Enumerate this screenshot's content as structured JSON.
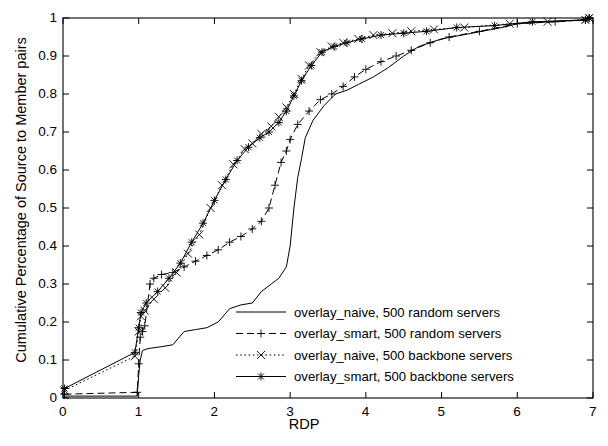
{
  "chart_data": {
    "type": "line",
    "title": "",
    "xlabel": "RDP",
    "ylabel": "Cumulative Percentage of Source to Member pairs",
    "xlim": [
      0,
      7
    ],
    "ylim": [
      0,
      1
    ],
    "xticks": [
      "0",
      "1",
      "2",
      "3",
      "4",
      "5",
      "6",
      "7"
    ],
    "yticks": [
      "0",
      "0.1",
      "0.2",
      "0.3",
      "0.4",
      "0.5",
      "0.6",
      "0.7",
      "0.8",
      "0.9",
      "1"
    ],
    "grid": false,
    "legend_position": "lower right",
    "series": [
      {
        "name": "overlay_naive, 500 random servers",
        "marker": "none",
        "dash": "solid",
        "points": [
          [
            0.02,
            0.005
          ],
          [
            0.98,
            0.005
          ],
          [
            1.0,
            0.06
          ],
          [
            1.02,
            0.1
          ],
          [
            1.05,
            0.125
          ],
          [
            1.12,
            0.13
          ],
          [
            1.3,
            0.135
          ],
          [
            1.45,
            0.14
          ],
          [
            1.6,
            0.175
          ],
          [
            1.75,
            0.18
          ],
          [
            1.9,
            0.185
          ],
          [
            2.05,
            0.2
          ],
          [
            2.2,
            0.235
          ],
          [
            2.35,
            0.245
          ],
          [
            2.5,
            0.25
          ],
          [
            2.62,
            0.28
          ],
          [
            2.75,
            0.3
          ],
          [
            2.85,
            0.315
          ],
          [
            2.95,
            0.345
          ],
          [
            3.0,
            0.4
          ],
          [
            3.05,
            0.5
          ],
          [
            3.1,
            0.58
          ],
          [
            3.15,
            0.63
          ],
          [
            3.2,
            0.685
          ],
          [
            3.3,
            0.73
          ],
          [
            3.45,
            0.77
          ],
          [
            3.6,
            0.8
          ],
          [
            3.75,
            0.81
          ],
          [
            3.9,
            0.825
          ],
          [
            4.1,
            0.845
          ],
          [
            4.3,
            0.87
          ],
          [
            4.5,
            0.9
          ],
          [
            4.7,
            0.925
          ],
          [
            5.0,
            0.945
          ],
          [
            5.4,
            0.96
          ],
          [
            5.8,
            0.975
          ],
          [
            6.0,
            0.985
          ],
          [
            6.4,
            0.99
          ],
          [
            6.9,
            0.995
          ],
          [
            6.95,
            1.0
          ]
        ]
      },
      {
        "name": "overlay_smart, 500 random servers",
        "marker": "plus",
        "dash": "dashed",
        "points": [
          [
            0.02,
            0.01
          ],
          [
            0.98,
            0.015
          ],
          [
            1.0,
            0.09
          ],
          [
            1.02,
            0.16
          ],
          [
            1.05,
            0.175
          ],
          [
            1.08,
            0.19
          ],
          [
            1.15,
            0.3
          ],
          [
            1.2,
            0.315
          ],
          [
            1.3,
            0.325
          ],
          [
            1.45,
            0.33
          ],
          [
            1.6,
            0.345
          ],
          [
            1.75,
            0.36
          ],
          [
            1.9,
            0.375
          ],
          [
            2.05,
            0.39
          ],
          [
            2.2,
            0.41
          ],
          [
            2.35,
            0.425
          ],
          [
            2.5,
            0.445
          ],
          [
            2.62,
            0.465
          ],
          [
            2.72,
            0.5
          ],
          [
            2.8,
            0.56
          ],
          [
            2.88,
            0.62
          ],
          [
            2.95,
            0.65
          ],
          [
            3.0,
            0.68
          ],
          [
            3.1,
            0.72
          ],
          [
            3.25,
            0.755
          ],
          [
            3.4,
            0.785
          ],
          [
            3.55,
            0.8
          ],
          [
            3.7,
            0.82
          ],
          [
            3.85,
            0.845
          ],
          [
            4.0,
            0.865
          ],
          [
            4.2,
            0.885
          ],
          [
            4.4,
            0.9
          ],
          [
            4.6,
            0.915
          ],
          [
            4.85,
            0.935
          ],
          [
            5.1,
            0.95
          ],
          [
            5.5,
            0.965
          ],
          [
            6.0,
            0.985
          ],
          [
            6.5,
            0.99
          ],
          [
            6.9,
            0.995
          ],
          [
            6.95,
            1.0
          ]
        ]
      },
      {
        "name": "overlay_naive, 500 backbone servers",
        "marker": "cross",
        "dash": "dotted",
        "points": [
          [
            0.02,
            0.02
          ],
          [
            0.95,
            0.11
          ],
          [
            1.0,
            0.175
          ],
          [
            1.03,
            0.215
          ],
          [
            1.08,
            0.23
          ],
          [
            1.2,
            0.26
          ],
          [
            1.35,
            0.29
          ],
          [
            1.5,
            0.33
          ],
          [
            1.65,
            0.38
          ],
          [
            1.8,
            0.43
          ],
          [
            1.95,
            0.5
          ],
          [
            2.1,
            0.56
          ],
          [
            2.25,
            0.615
          ],
          [
            2.4,
            0.655
          ],
          [
            2.5,
            0.67
          ],
          [
            2.62,
            0.695
          ],
          [
            2.75,
            0.715
          ],
          [
            2.85,
            0.74
          ],
          [
            2.95,
            0.765
          ],
          [
            3.05,
            0.8
          ],
          [
            3.15,
            0.84
          ],
          [
            3.25,
            0.875
          ],
          [
            3.4,
            0.91
          ],
          [
            3.55,
            0.925
          ],
          [
            3.7,
            0.935
          ],
          [
            3.9,
            0.945
          ],
          [
            4.1,
            0.955
          ],
          [
            4.35,
            0.96
          ],
          [
            4.6,
            0.965
          ],
          [
            4.9,
            0.97
          ],
          [
            5.3,
            0.975
          ],
          [
            5.9,
            0.985
          ],
          [
            6.4,
            0.99
          ],
          [
            6.9,
            0.995
          ],
          [
            6.95,
            1.0
          ]
        ]
      },
      {
        "name": "overlay_smart, 500 backbone servers",
        "marker": "star",
        "dash": "solid-marked",
        "points": [
          [
            0.02,
            0.025
          ],
          [
            0.95,
            0.12
          ],
          [
            1.0,
            0.185
          ],
          [
            1.03,
            0.225
          ],
          [
            1.1,
            0.25
          ],
          [
            1.25,
            0.28
          ],
          [
            1.4,
            0.315
          ],
          [
            1.55,
            0.355
          ],
          [
            1.7,
            0.41
          ],
          [
            1.85,
            0.46
          ],
          [
            2.0,
            0.52
          ],
          [
            2.15,
            0.575
          ],
          [
            2.3,
            0.625
          ],
          [
            2.45,
            0.66
          ],
          [
            2.6,
            0.685
          ],
          [
            2.72,
            0.7
          ],
          [
            2.85,
            0.725
          ],
          [
            2.95,
            0.755
          ],
          [
            3.05,
            0.795
          ],
          [
            3.15,
            0.835
          ],
          [
            3.28,
            0.875
          ],
          [
            3.42,
            0.91
          ],
          [
            3.58,
            0.925
          ],
          [
            3.75,
            0.935
          ],
          [
            3.95,
            0.945
          ],
          [
            4.2,
            0.955
          ],
          [
            4.5,
            0.96
          ],
          [
            4.8,
            0.965
          ],
          [
            5.2,
            0.975
          ],
          [
            5.7,
            0.98
          ],
          [
            6.2,
            0.99
          ],
          [
            6.9,
            0.995
          ],
          [
            6.95,
            1.0
          ]
        ]
      }
    ],
    "legend": [
      "overlay_naive, 500 random servers",
      "overlay_smart, 500 random servers",
      "overlay_naive, 500 backbone servers",
      "overlay_smart, 500 backbone servers"
    ]
  }
}
